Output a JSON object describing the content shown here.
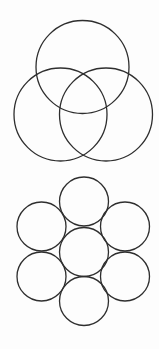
{
  "diagram": {
    "stroke_color": "#2e2e2e",
    "stroke_width": 1.3,
    "background": "#fdfdfd",
    "groups": [
      {
        "name": "three-circle-venn",
        "circles": [
          {
            "name": "top",
            "cx": 82.5,
            "cy": 67,
            "r": 46.5
          },
          {
            "name": "left",
            "cx": 60.5,
            "cy": 114.5,
            "r": 46.5
          },
          {
            "name": "right",
            "cx": 106,
            "cy": 114.5,
            "r": 46.5
          }
        ]
      },
      {
        "name": "seven-circle-hexagonal-packing",
        "circles": [
          {
            "name": "top",
            "cx": 84,
            "cy": 201.5,
            "r": 24.5
          },
          {
            "name": "upper-left",
            "cx": 41.5,
            "cy": 226.5,
            "r": 24.5
          },
          {
            "name": "upper-right",
            "cx": 125,
            "cy": 226.5,
            "r": 24.5
          },
          {
            "name": "center",
            "cx": 84,
            "cy": 252,
            "r": 24.5
          },
          {
            "name": "lower-left",
            "cx": 41.5,
            "cy": 276.5,
            "r": 24.5
          },
          {
            "name": "lower-right",
            "cx": 125,
            "cy": 276.5,
            "r": 24.5
          },
          {
            "name": "bottom",
            "cx": 84,
            "cy": 301,
            "r": 24.5
          }
        ]
      }
    ]
  }
}
